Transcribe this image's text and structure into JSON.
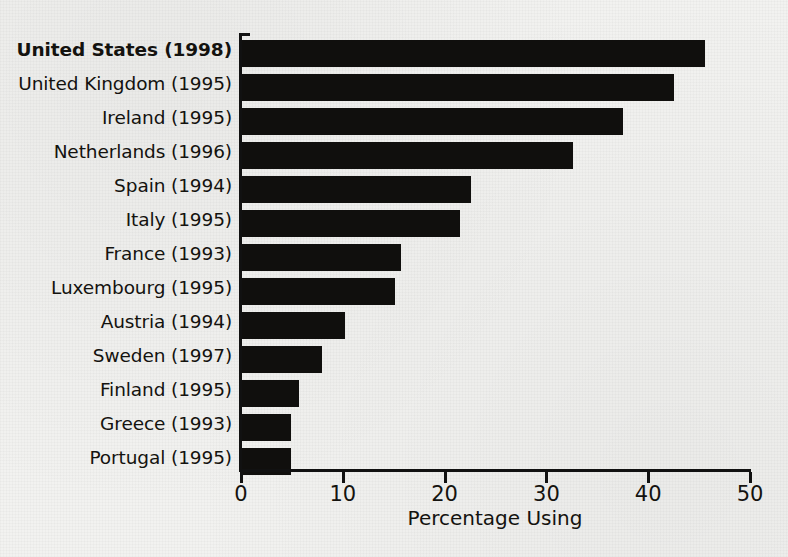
{
  "chart_data": {
    "type": "bar",
    "orientation": "horizontal",
    "title": "",
    "xlabel": "Percentage Using",
    "ylabel": "",
    "xlim": [
      0,
      50
    ],
    "xticks": [
      0,
      10,
      20,
      30,
      40,
      50
    ],
    "xtick_labels": [
      "0",
      "10",
      "20",
      "30",
      "40",
      "50"
    ],
    "grid": false,
    "legend": null,
    "bar_color": "#100f0d",
    "background_color": "#f2f2f0",
    "categories": [
      "United States (1998)",
      "United Kingdom (1995)",
      "Ireland (1995)",
      "Netherlands (1996)",
      "Spain (1994)",
      "Italy (1995)",
      "France (1993)",
      "Luxembourg (1995)",
      "Austria (1994)",
      "Sweden (1997)",
      "Finland (1995)",
      "Greece (1993)",
      "Portugal (1995)"
    ],
    "values": [
      45.5,
      42.4,
      37.4,
      32.5,
      22.5,
      21.4,
      15.6,
      15.0,
      10.1,
      7.9,
      5.6,
      4.8,
      4.8
    ],
    "emphasized_categories": [
      "United States (1998)"
    ]
  }
}
